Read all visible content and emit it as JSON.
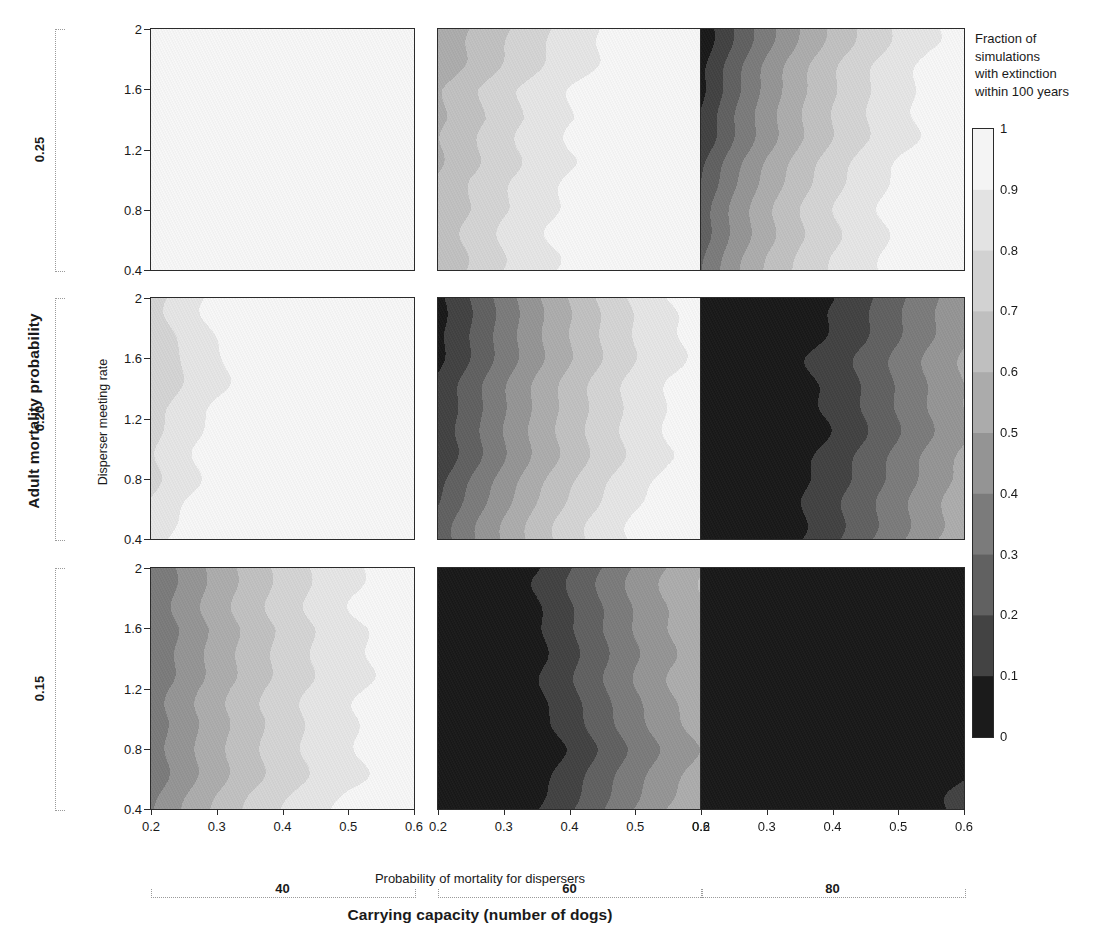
{
  "figure": {
    "row_axis_title": "Adult mortality probability",
    "col_axis_title": "Carrying capacity (number of dogs)",
    "x_axis_title": "Probability of mortality for dispersers",
    "y_axis_title": "Disperser meeting rate"
  },
  "legend": {
    "title_lines": [
      "Fraction of",
      "simulations",
      "with extinction",
      "within 100 years"
    ],
    "ticks": [
      "1",
      "0.9",
      "0.8",
      "0.7",
      "0.6",
      "0.5",
      "0.4",
      "0.3",
      "0.2",
      "0.1",
      "0"
    ],
    "colors": [
      "#f4f4f4",
      "#e3e3e3",
      "#d2d2d2",
      "#bfbfbf",
      "#ababab",
      "#949494",
      "#7b7b7b",
      "#616161",
      "#434343",
      "#1b1b1b"
    ]
  },
  "axes": {
    "x_ticks": [
      "0.2",
      "0.3",
      "0.4",
      "0.5",
      "0.6"
    ],
    "x_values": [
      0.2,
      0.3,
      0.4,
      0.5,
      0.6
    ],
    "y_ticks": [
      "2",
      "1.6",
      "1.2",
      "0.8",
      "0.4"
    ],
    "y_values": [
      2,
      1.6,
      1.2,
      0.8,
      0.4
    ]
  },
  "row_groups": [
    {
      "label": "0.25",
      "value": 0.25
    },
    {
      "label": "0.20",
      "value": 0.2
    },
    {
      "label": "0.15",
      "value": 0.15
    }
  ],
  "col_groups": [
    {
      "label": "40",
      "value": 40
    },
    {
      "label": "60",
      "value": 60
    },
    {
      "label": "80",
      "value": 80
    }
  ],
  "chart_data": {
    "type": "heatmap",
    "title": "",
    "xlabel": "Probability of mortality for dispersers",
    "ylabel": "Disperser meeting rate",
    "xlim": [
      0.2,
      0.6
    ],
    "ylim": [
      0.4,
      2.0
    ],
    "zlabel": "Fraction of simulations with extinction within 100 years",
    "zlim": [
      0,
      1
    ],
    "contour_levels": [
      0,
      0.1,
      0.2,
      0.3,
      0.4,
      0.5,
      0.6,
      0.7,
      0.8,
      0.9,
      1.0
    ],
    "colormap": "grayscale-reversed",
    "grid": false,
    "row_variable": "Adult mortality probability",
    "col_variable": "Carrying capacity (number of dogs)",
    "row_levels": [
      0.25,
      0.2,
      0.15
    ],
    "col_levels": [
      40,
      60,
      80
    ],
    "x": [
      0.2,
      0.25,
      0.3,
      0.35,
      0.4,
      0.45,
      0.5,
      0.55,
      0.6
    ],
    "y": [
      2.0,
      1.8,
      1.6,
      1.4,
      1.2,
      1.0,
      0.8,
      0.6,
      0.4
    ],
    "panels": [
      {
        "row": 0.25,
        "col": 40,
        "note": "uniformly near-total extinction",
        "z": [
          [
            0.98,
            0.99,
            1.0,
            1.0,
            1.0,
            1.0,
            1.0,
            1.0,
            1.0
          ],
          [
            0.98,
            0.99,
            1.0,
            1.0,
            1.0,
            1.0,
            1.0,
            1.0,
            1.0
          ],
          [
            0.98,
            0.99,
            1.0,
            1.0,
            1.0,
            1.0,
            1.0,
            1.0,
            1.0
          ],
          [
            0.98,
            0.99,
            1.0,
            1.0,
            1.0,
            1.0,
            1.0,
            1.0,
            1.0
          ],
          [
            0.98,
            0.99,
            1.0,
            1.0,
            1.0,
            1.0,
            1.0,
            1.0,
            1.0
          ],
          [
            0.98,
            0.99,
            1.0,
            1.0,
            1.0,
            1.0,
            1.0,
            1.0,
            1.0
          ],
          [
            0.98,
            0.99,
            1.0,
            1.0,
            1.0,
            1.0,
            1.0,
            1.0,
            1.0
          ],
          [
            0.98,
            0.99,
            1.0,
            1.0,
            1.0,
            1.0,
            1.0,
            1.0,
            1.0
          ],
          [
            0.98,
            0.99,
            1.0,
            1.0,
            1.0,
            1.0,
            1.0,
            1.0,
            1.0
          ]
        ]
      },
      {
        "row": 0.25,
        "col": 60,
        "note": "banded gradient, 0.55 at left to 1.0 at right",
        "z": [
          [
            0.55,
            0.62,
            0.7,
            0.78,
            0.86,
            0.92,
            0.96,
            0.99,
            1.0
          ],
          [
            0.56,
            0.64,
            0.73,
            0.81,
            0.88,
            0.93,
            0.97,
            0.99,
            1.0
          ],
          [
            0.58,
            0.67,
            0.76,
            0.83,
            0.89,
            0.94,
            0.97,
            0.99,
            1.0
          ],
          [
            0.57,
            0.65,
            0.74,
            0.82,
            0.88,
            0.93,
            0.97,
            0.99,
            1.0
          ],
          [
            0.59,
            0.68,
            0.77,
            0.84,
            0.9,
            0.94,
            0.97,
            0.99,
            1.0
          ],
          [
            0.61,
            0.7,
            0.78,
            0.85,
            0.91,
            0.95,
            0.98,
            0.99,
            1.0
          ],
          [
            0.6,
            0.69,
            0.78,
            0.85,
            0.91,
            0.95,
            0.98,
            1.0,
            1.0
          ],
          [
            0.62,
            0.71,
            0.8,
            0.87,
            0.92,
            0.96,
            0.98,
            1.0,
            1.0
          ],
          [
            0.64,
            0.73,
            0.82,
            0.89,
            0.94,
            0.97,
            0.99,
            1.0,
            1.0
          ]
        ]
      },
      {
        "row": 0.25,
        "col": 80,
        "note": "dark wedge upper-left, light at right",
        "z": [
          [
            0.05,
            0.22,
            0.38,
            0.52,
            0.64,
            0.75,
            0.84,
            0.91,
            0.96
          ],
          [
            0.06,
            0.24,
            0.41,
            0.55,
            0.67,
            0.77,
            0.85,
            0.92,
            0.96
          ],
          [
            0.08,
            0.27,
            0.44,
            0.58,
            0.69,
            0.79,
            0.87,
            0.93,
            0.97
          ],
          [
            0.12,
            0.31,
            0.47,
            0.6,
            0.71,
            0.8,
            0.88,
            0.93,
            0.97
          ],
          [
            0.16,
            0.34,
            0.49,
            0.62,
            0.73,
            0.82,
            0.89,
            0.94,
            0.98
          ],
          [
            0.19,
            0.37,
            0.52,
            0.64,
            0.75,
            0.83,
            0.9,
            0.95,
            0.98
          ],
          [
            0.22,
            0.4,
            0.55,
            0.67,
            0.77,
            0.85,
            0.91,
            0.96,
            0.99
          ],
          [
            0.26,
            0.44,
            0.58,
            0.7,
            0.79,
            0.87,
            0.93,
            0.97,
            0.99
          ],
          [
            0.3,
            0.48,
            0.62,
            0.73,
            0.82,
            0.89,
            0.94,
            0.98,
            1.0
          ]
        ]
      },
      {
        "row": 0.2,
        "col": 40,
        "note": "light gray band at far left, white elsewhere",
        "z": [
          [
            0.74,
            0.84,
            0.92,
            0.98,
            1.0,
            1.0,
            1.0,
            1.0,
            1.0
          ],
          [
            0.73,
            0.83,
            0.91,
            0.97,
            1.0,
            1.0,
            1.0,
            1.0,
            1.0
          ],
          [
            0.72,
            0.82,
            0.9,
            0.97,
            0.99,
            1.0,
            1.0,
            1.0,
            1.0
          ],
          [
            0.74,
            0.84,
            0.91,
            0.97,
            0.99,
            1.0,
            1.0,
            1.0,
            1.0
          ],
          [
            0.76,
            0.85,
            0.92,
            0.98,
            1.0,
            1.0,
            1.0,
            1.0,
            1.0
          ],
          [
            0.78,
            0.87,
            0.94,
            0.98,
            1.0,
            1.0,
            1.0,
            1.0,
            1.0
          ],
          [
            0.79,
            0.88,
            0.95,
            0.99,
            1.0,
            1.0,
            1.0,
            1.0,
            1.0
          ],
          [
            0.81,
            0.9,
            0.96,
            0.99,
            1.0,
            1.0,
            1.0,
            1.0,
            1.0
          ],
          [
            0.83,
            0.92,
            0.97,
            1.0,
            1.0,
            1.0,
            1.0,
            1.0,
            1.0
          ]
        ]
      },
      {
        "row": 0.2,
        "col": 60,
        "note": "even dark-to-light banding across full range",
        "z": [
          [
            0.05,
            0.18,
            0.32,
            0.46,
            0.58,
            0.7,
            0.8,
            0.88,
            0.94
          ],
          [
            0.07,
            0.2,
            0.34,
            0.48,
            0.6,
            0.71,
            0.81,
            0.89,
            0.94
          ],
          [
            0.09,
            0.22,
            0.36,
            0.49,
            0.61,
            0.72,
            0.82,
            0.89,
            0.95
          ],
          [
            0.11,
            0.24,
            0.38,
            0.51,
            0.63,
            0.74,
            0.83,
            0.9,
            0.95
          ],
          [
            0.13,
            0.26,
            0.4,
            0.53,
            0.65,
            0.75,
            0.84,
            0.91,
            0.96
          ],
          [
            0.15,
            0.28,
            0.42,
            0.55,
            0.66,
            0.77,
            0.85,
            0.92,
            0.96
          ],
          [
            0.17,
            0.31,
            0.44,
            0.57,
            0.68,
            0.78,
            0.86,
            0.92,
            0.97
          ],
          [
            0.2,
            0.34,
            0.47,
            0.6,
            0.71,
            0.8,
            0.88,
            0.94,
            0.97
          ],
          [
            0.23,
            0.37,
            0.5,
            0.63,
            0.74,
            0.83,
            0.9,
            0.95,
            0.98
          ]
        ]
      },
      {
        "row": 0.2,
        "col": 80,
        "note": "mostly zero, thin gray bands at right edge",
        "z": [
          [
            0.0,
            0.01,
            0.02,
            0.05,
            0.1,
            0.18,
            0.28,
            0.38,
            0.47
          ],
          [
            0.0,
            0.01,
            0.02,
            0.05,
            0.11,
            0.19,
            0.29,
            0.39,
            0.48
          ],
          [
            0.0,
            0.01,
            0.02,
            0.06,
            0.12,
            0.2,
            0.3,
            0.4,
            0.49
          ],
          [
            0.0,
            0.01,
            0.03,
            0.06,
            0.12,
            0.21,
            0.31,
            0.41,
            0.5
          ],
          [
            0.0,
            0.01,
            0.03,
            0.07,
            0.13,
            0.22,
            0.32,
            0.42,
            0.51
          ],
          [
            0.0,
            0.01,
            0.03,
            0.07,
            0.14,
            0.23,
            0.33,
            0.43,
            0.52
          ],
          [
            0.0,
            0.01,
            0.03,
            0.08,
            0.15,
            0.24,
            0.34,
            0.44,
            0.53
          ],
          [
            0.0,
            0.02,
            0.04,
            0.09,
            0.17,
            0.26,
            0.36,
            0.46,
            0.55
          ],
          [
            0.0,
            0.02,
            0.05,
            0.11,
            0.19,
            0.29,
            0.39,
            0.49,
            0.58
          ]
        ]
      },
      {
        "row": 0.15,
        "col": 40,
        "note": "mid gray at left rising to near white at right",
        "z": [
          [
            0.33,
            0.44,
            0.55,
            0.65,
            0.74,
            0.82,
            0.88,
            0.93,
            0.97
          ],
          [
            0.31,
            0.42,
            0.53,
            0.63,
            0.72,
            0.8,
            0.87,
            0.92,
            0.96
          ],
          [
            0.3,
            0.41,
            0.52,
            0.62,
            0.71,
            0.79,
            0.86,
            0.91,
            0.96
          ],
          [
            0.32,
            0.43,
            0.54,
            0.64,
            0.73,
            0.81,
            0.87,
            0.92,
            0.96
          ],
          [
            0.34,
            0.45,
            0.56,
            0.66,
            0.75,
            0.82,
            0.88,
            0.93,
            0.97
          ],
          [
            0.33,
            0.44,
            0.55,
            0.65,
            0.74,
            0.82,
            0.88,
            0.93,
            0.97
          ],
          [
            0.35,
            0.46,
            0.57,
            0.67,
            0.76,
            0.83,
            0.89,
            0.94,
            0.97
          ],
          [
            0.37,
            0.49,
            0.6,
            0.7,
            0.78,
            0.85,
            0.91,
            0.95,
            0.98
          ],
          [
            0.4,
            0.52,
            0.63,
            0.73,
            0.81,
            0.88,
            0.93,
            0.96,
            0.99
          ]
        ]
      },
      {
        "row": 0.15,
        "col": 60,
        "note": "black block on left half, gray bands at right",
        "z": [
          [
            0.0,
            0.01,
            0.03,
            0.09,
            0.19,
            0.3,
            0.41,
            0.5,
            0.58
          ],
          [
            0.0,
            0.01,
            0.03,
            0.1,
            0.2,
            0.31,
            0.42,
            0.51,
            0.59
          ],
          [
            0.0,
            0.01,
            0.03,
            0.09,
            0.19,
            0.3,
            0.41,
            0.5,
            0.58
          ],
          [
            0.0,
            0.01,
            0.02,
            0.07,
            0.17,
            0.28,
            0.39,
            0.48,
            0.56
          ],
          [
            0.0,
            0.0,
            0.02,
            0.06,
            0.15,
            0.26,
            0.37,
            0.47,
            0.55
          ],
          [
            0.0,
            0.0,
            0.01,
            0.05,
            0.14,
            0.25,
            0.36,
            0.46,
            0.54
          ],
          [
            0.0,
            0.0,
            0.01,
            0.05,
            0.13,
            0.24,
            0.35,
            0.45,
            0.53
          ],
          [
            0.0,
            0.0,
            0.02,
            0.06,
            0.15,
            0.26,
            0.37,
            0.47,
            0.55
          ],
          [
            0.0,
            0.01,
            0.03,
            0.09,
            0.18,
            0.29,
            0.4,
            0.5,
            0.58
          ]
        ]
      },
      {
        "row": 0.15,
        "col": 80,
        "note": "essentially no extinction anywhere; faint corner at bottom right",
        "z": [
          [
            0.0,
            0.0,
            0.0,
            0.0,
            0.0,
            0.0,
            0.0,
            0.0,
            0.01
          ],
          [
            0.0,
            0.0,
            0.0,
            0.0,
            0.0,
            0.0,
            0.0,
            0.0,
            0.01
          ],
          [
            0.0,
            0.0,
            0.0,
            0.0,
            0.0,
            0.0,
            0.0,
            0.0,
            0.01
          ],
          [
            0.0,
            0.0,
            0.0,
            0.0,
            0.0,
            0.0,
            0.0,
            0.0,
            0.01
          ],
          [
            0.0,
            0.0,
            0.0,
            0.0,
            0.0,
            0.0,
            0.0,
            0.01,
            0.02
          ],
          [
            0.0,
            0.0,
            0.0,
            0.0,
            0.0,
            0.0,
            0.0,
            0.01,
            0.03
          ],
          [
            0.0,
            0.0,
            0.0,
            0.0,
            0.0,
            0.0,
            0.01,
            0.02,
            0.05
          ],
          [
            0.0,
            0.0,
            0.0,
            0.0,
            0.0,
            0.01,
            0.02,
            0.05,
            0.09
          ],
          [
            0.0,
            0.0,
            0.0,
            0.0,
            0.01,
            0.02,
            0.04,
            0.08,
            0.14
          ]
        ]
      }
    ]
  }
}
